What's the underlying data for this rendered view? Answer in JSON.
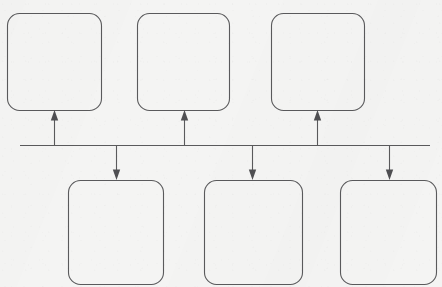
{
  "diagram": {
    "title": "",
    "canvas": {
      "width": 442,
      "height": 287,
      "background_color": "#f4f4f3"
    },
    "stroke_color": "#5a5a5c",
    "arrow_fill_color": "#4f4f52",
    "bus": {
      "label": "",
      "y": 145,
      "x_start": 20,
      "x_end": 430
    },
    "top_nodes": [
      {
        "label": "",
        "x": 7,
        "y": 13,
        "width": 94,
        "height": 97,
        "radius": 12
      },
      {
        "label": "",
        "x": 137,
        "y": 13,
        "width": 92,
        "height": 97,
        "radius": 12
      },
      {
        "label": "",
        "x": 271,
        "y": 13,
        "width": 93,
        "height": 97,
        "radius": 12
      }
    ],
    "bottom_nodes": [
      {
        "label": "",
        "x": 68,
        "y": 180,
        "width": 95,
        "height": 104,
        "radius": 12
      },
      {
        "label": "",
        "x": 204,
        "y": 180,
        "width": 98,
        "height": 104,
        "radius": 12
      },
      {
        "label": "",
        "x": 340,
        "y": 180,
        "width": 96,
        "height": 104,
        "radius": 12
      }
    ],
    "up_arrows": [
      {
        "label": "",
        "x": 54,
        "y_from": 145,
        "y_to": 111
      },
      {
        "label": "",
        "x": 184,
        "y_from": 145,
        "y_to": 111
      },
      {
        "label": "",
        "x": 317,
        "y_from": 145,
        "y_to": 111
      }
    ],
    "down_arrows": [
      {
        "label": "",
        "x": 116,
        "y_from": 145,
        "y_to": 179
      },
      {
        "label": "",
        "x": 252,
        "y_from": 145,
        "y_to": 179
      },
      {
        "label": "",
        "x": 389,
        "y_from": 145,
        "y_to": 179
      }
    ]
  }
}
